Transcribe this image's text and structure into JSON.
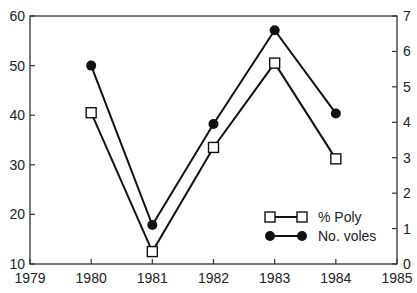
{
  "chart_data": {
    "type": "line",
    "title": "",
    "xlabel": "",
    "ylabel": "",
    "y2label": "",
    "x": [
      1980,
      1981,
      1982,
      1983,
      1984
    ],
    "xlim": [
      1979,
      1985
    ],
    "xticks": [
      "1979",
      "1980",
      "1981",
      "1982",
      "1983",
      "1984",
      "1985"
    ],
    "ylim": [
      10,
      60
    ],
    "yticks": [
      "10",
      "20",
      "30",
      "40",
      "50",
      "60"
    ],
    "y2lim": [
      0,
      7
    ],
    "y2ticks": [
      "0",
      "1",
      "2",
      "3",
      "4",
      "5",
      "6",
      "7"
    ],
    "grid": false,
    "legend_position": "lower right",
    "series": [
      {
        "name": "% Poly",
        "axis": "left",
        "marker": "open-square",
        "values": [
          40.5,
          12.5,
          33.5,
          50.5,
          31.2
        ]
      },
      {
        "name": "No. voles",
        "axis": "right",
        "marker": "filled-circle",
        "values": [
          5.6,
          1.1,
          3.95,
          6.6,
          4.25
        ]
      }
    ]
  },
  "legend": {
    "poly_label": "% Poly",
    "voles_label": "No. voles"
  }
}
